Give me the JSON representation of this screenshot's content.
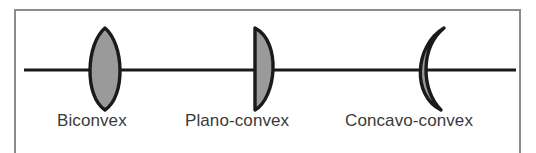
{
  "figure": {
    "background_color": "#ffffff",
    "frame_color": "#8c8c8c",
    "axis_color": "#1a1a1a",
    "lens_fill_color": "#9a9a9a",
    "lens_outline_color": "#1a1a1a",
    "label_color": "#3a3a3a"
  },
  "optical_axis": {
    "name": "optical-axis",
    "x_start": 24,
    "x_end": 516,
    "y": 70
  },
  "lenses": [
    {
      "label": "Biconvex",
      "shape": "biconvex",
      "description": "both surfaces convex",
      "center_x": 105,
      "top_y": 28,
      "bottom_y": 110,
      "half_width": 21
    },
    {
      "label": "Plano-convex",
      "shape": "plano-convex",
      "description": "flat left surface, convex right surface",
      "center_x": 266,
      "top_y": 28,
      "bottom_y": 110,
      "half_width": 13
    },
    {
      "label": "Concavo-convex",
      "shape": "concavo-convex",
      "description": "concave left surface, convex right surface (meniscus crescent)",
      "center_x": 432,
      "top_y": 28,
      "bottom_y": 110,
      "half_width": 18
    }
  ]
}
